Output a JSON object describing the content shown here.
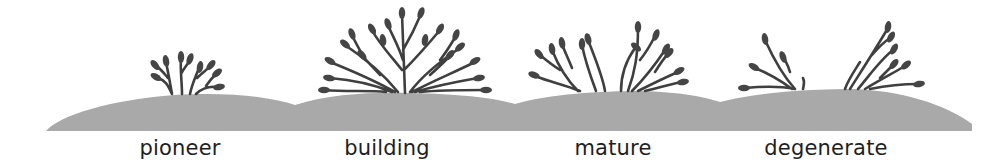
{
  "diagram": {
    "colors": {
      "ground": "#a9a9a9",
      "plant": "#404040",
      "text": "#1e1e1e",
      "background": "#ffffff"
    },
    "stages": [
      {
        "id": "pioneer",
        "label": "pioneer",
        "label_x": 180
      },
      {
        "id": "building",
        "label": "building",
        "label_x": 387
      },
      {
        "id": "mature",
        "label": "mature",
        "label_x": 613
      },
      {
        "id": "degenerate",
        "label": "degenerate",
        "label_x": 826
      }
    ]
  }
}
